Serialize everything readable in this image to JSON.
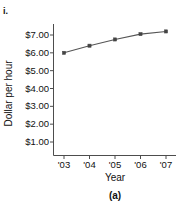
{
  "figure": {
    "item_label": "i.",
    "caption": "(a)",
    "top_cut_text": "",
    "line_color": "#555555",
    "marker_color": "#444444",
    "axis_color": "#4d4d4d",
    "text_color": "#111111"
  },
  "chart_data": {
    "type": "line",
    "title": "",
    "xlabel": "Year",
    "ylabel": "Dollar per hour",
    "categories": [
      "'03",
      "'04",
      "'05",
      "'06",
      "'07"
    ],
    "x": [
      2003,
      2004,
      2005,
      2006,
      2007
    ],
    "values": [
      6.0,
      6.4,
      6.75,
      7.05,
      7.2
    ],
    "ytick_labels": [
      "$1.00",
      "$2.00",
      "$3.00",
      "$4.00",
      "$5.00",
      "$6.00",
      "$7.00"
    ],
    "ytick_values": [
      1,
      2,
      3,
      4,
      5,
      6,
      7
    ],
    "ylim": [
      0,
      7.9
    ],
    "xlim": [
      2002.6,
      2007.6
    ],
    "grid": false,
    "legend": null,
    "marker": "square"
  }
}
